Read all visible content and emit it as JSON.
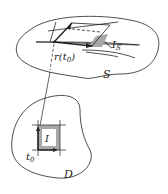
{
  "diagram": {
    "surface_label": "S",
    "patch_label_base": "I",
    "patch_label_sub": "S",
    "point_label": "r(t",
    "point_label_sub": "0",
    "point_label_close": ")",
    "domain_label": "D",
    "rect_label": "I",
    "param_label_base": "t",
    "param_label_sub": "0"
  },
  "colors": {
    "stroke": "#222222",
    "shade": "#a8a8a8"
  }
}
